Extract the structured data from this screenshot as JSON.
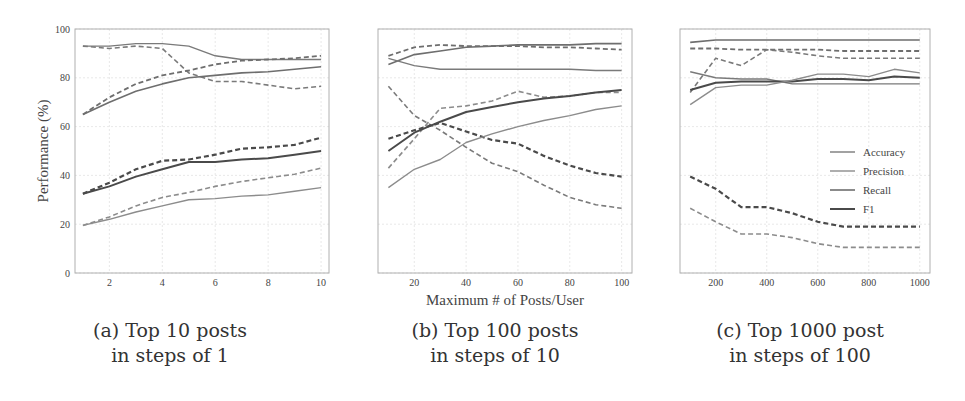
{
  "figure": {
    "ylabel": "Performance (%)",
    "shared_xlabel": "Maximum # of Posts/User",
    "legend": [
      {
        "label": "Accuracy",
        "color": "#7a7a7a",
        "width": 1.4
      },
      {
        "label": "Precision",
        "color": "#8c8c8c",
        "width": 1.4
      },
      {
        "label": "Recall",
        "color": "#6e6e6e",
        "width": 1.6
      },
      {
        "label": "F1",
        "color": "#4a4a4a",
        "width": 2.0
      }
    ],
    "colors": {
      "background": "#ffffff",
      "axis": "#b0b0b0",
      "grid": "#e2e2e2",
      "text": "#444444"
    }
  },
  "captions": [
    {
      "line1": "(a) Top 10 posts",
      "line2": "in steps of 1"
    },
    {
      "line1": "(b) Top 100 posts",
      "line2": "in steps of 10"
    },
    {
      "line1": "(c) Top 1000 post",
      "line2": "in steps of 100"
    }
  ],
  "chart_data": [
    {
      "type": "line",
      "title": "(a) Top 10 posts in steps of 1",
      "xlabel": "",
      "ylabel": "Performance (%)",
      "xlim": [
        0.7,
        10.3
      ],
      "ylim": [
        0,
        100
      ],
      "xticks": [
        2,
        4,
        6,
        8,
        10
      ],
      "yticks": [
        0,
        20,
        40,
        60,
        80,
        100
      ],
      "grid": true,
      "x": [
        1,
        2,
        3,
        4,
        5,
        6,
        7,
        8,
        9,
        10
      ],
      "series": [
        {
          "name": "Accuracy (solid)",
          "metric": "Accuracy",
          "style": "solid",
          "values": [
            93,
            93,
            94,
            94,
            93,
            89,
            87.5,
            87.5,
            87.5,
            87.5
          ]
        },
        {
          "name": "Accuracy (dashed)",
          "metric": "Accuracy",
          "style": "dashed",
          "values": [
            93,
            92,
            93,
            92,
            82,
            78.5,
            78.5,
            77,
            75.5,
            76.5
          ]
        },
        {
          "name": "Recall (solid)",
          "metric": "Recall",
          "style": "solid",
          "values": [
            65,
            70,
            74.5,
            77.5,
            80,
            81,
            82,
            82.5,
            83.5,
            84.5
          ]
        },
        {
          "name": "Recall (dashed)",
          "metric": "Recall",
          "style": "dashed",
          "values": [
            65,
            72,
            77.5,
            81,
            83,
            85.5,
            87,
            87.5,
            88,
            89
          ]
        },
        {
          "name": "F1 (solid)",
          "metric": "F1",
          "style": "solid",
          "values": [
            32.5,
            35.5,
            39.5,
            42.5,
            45.5,
            45.5,
            46.5,
            47,
            48.5,
            50
          ]
        },
        {
          "name": "F1 (dashed)",
          "metric": "F1",
          "style": "dashed",
          "values": [
            32.5,
            37,
            42.5,
            46,
            46.5,
            48.5,
            51,
            51.5,
            52.5,
            55.5
          ]
        },
        {
          "name": "Precision (solid)",
          "metric": "Precision",
          "style": "solid",
          "values": [
            19.5,
            22,
            25,
            27.5,
            30,
            30.5,
            31.5,
            32,
            33.5,
            35
          ]
        },
        {
          "name": "Precision (dashed)",
          "metric": "Precision",
          "style": "dashed",
          "values": [
            19.5,
            23,
            27.5,
            31,
            33,
            35.5,
            37.5,
            39,
            40.5,
            43
          ]
        }
      ]
    },
    {
      "type": "line",
      "title": "(b) Top 100 posts in steps of 10",
      "xlabel": "Maximum # of Posts/User",
      "ylabel": "",
      "xlim": [
        6,
        104
      ],
      "ylim": [
        0,
        100
      ],
      "xticks": [
        20,
        40,
        60,
        80,
        100
      ],
      "yticks": [
        0,
        20,
        40,
        60,
        80,
        100
      ],
      "grid": true,
      "x": [
        10,
        20,
        30,
        40,
        50,
        60,
        70,
        80,
        90,
        100
      ],
      "series": [
        {
          "name": "Recall (solid)",
          "metric": "Recall",
          "style": "solid",
          "values": [
            85.5,
            89.5,
            91,
            92.5,
            93,
            93.5,
            93.5,
            93.5,
            94,
            94
          ]
        },
        {
          "name": "Recall (dashed)",
          "metric": "Recall",
          "style": "dashed",
          "values": [
            89,
            92.5,
            93.5,
            93,
            93,
            93,
            92.5,
            92.5,
            92,
            91.5
          ]
        },
        {
          "name": "Accuracy (solid)",
          "metric": "Accuracy",
          "style": "solid",
          "values": [
            88,
            85,
            83.5,
            83.5,
            83.5,
            83.5,
            83.5,
            83.5,
            83,
            83
          ]
        },
        {
          "name": "Accuracy (dashed)",
          "metric": "Accuracy",
          "style": "dashed",
          "values": [
            76.5,
            64.5,
            58.5,
            51.5,
            45,
            41.5,
            36,
            31,
            28,
            26.5
          ]
        },
        {
          "name": "Precision (dashed)",
          "metric": "Precision",
          "style": "dashed",
          "values": [
            43,
            55,
            67.5,
            68.5,
            70.5,
            74.5,
            72,
            72.5,
            74,
            74
          ]
        },
        {
          "name": "F1 (solid)",
          "metric": "F1",
          "style": "solid",
          "values": [
            50,
            57.5,
            62,
            66,
            68,
            70,
            71.5,
            72.5,
            74,
            75
          ]
        },
        {
          "name": "F1 (dashed)",
          "metric": "F1",
          "style": "dashed",
          "values": [
            55,
            58.5,
            61.5,
            58,
            54.5,
            53,
            48,
            44,
            41,
            39.5
          ]
        },
        {
          "name": "Precision (solid)",
          "metric": "Precision",
          "style": "solid",
          "values": [
            35,
            42.5,
            46.5,
            53.5,
            57,
            60,
            62.5,
            64.5,
            67,
            68.5
          ]
        }
      ]
    },
    {
      "type": "line",
      "title": "(c) Top 1000 post in steps of 100",
      "xlabel": "",
      "ylabel": "",
      "xlim": [
        60,
        1040
      ],
      "ylim": [
        0,
        100
      ],
      "xticks": [
        200,
        400,
        600,
        800,
        1000
      ],
      "yticks": [
        0,
        20,
        40,
        60,
        80,
        100
      ],
      "grid": true,
      "legend_position": "center right",
      "x": [
        100,
        200,
        300,
        400,
        500,
        600,
        700,
        800,
        900,
        1000
      ],
      "series": [
        {
          "name": "Recall (solid)",
          "metric": "Recall",
          "style": "solid",
          "values": [
            94.5,
            95.5,
            95.5,
            95.5,
            95.5,
            95.5,
            95.5,
            95.5,
            95.5,
            95.5
          ]
        },
        {
          "name": "Recall (dashed)",
          "metric": "Recall",
          "style": "dashed",
          "values": [
            92,
            92,
            91.5,
            91.5,
            91.5,
            91.5,
            91,
            91,
            91,
            91
          ]
        },
        {
          "name": "Accuracy (dashed)",
          "metric": "Accuracy",
          "style": "dashed",
          "values": [
            74,
            88,
            85,
            91.5,
            90.5,
            89,
            88,
            88,
            88,
            88
          ]
        },
        {
          "name": "Accuracy (solid)",
          "metric": "Accuracy",
          "style": "solid",
          "values": [
            82.5,
            80,
            79.5,
            79.5,
            77.5,
            77.5,
            77.5,
            77.5,
            77.5,
            77.5
          ]
        },
        {
          "name": "F1 (solid)",
          "metric": "F1",
          "style": "solid",
          "values": [
            75,
            78,
            78.5,
            78.5,
            78.5,
            79.5,
            79.5,
            79,
            80.5,
            80
          ]
        },
        {
          "name": "Precision (solid)",
          "metric": "Precision",
          "style": "solid",
          "values": [
            69,
            76,
            77,
            77,
            79,
            81.5,
            81.5,
            80.5,
            83.5,
            82
          ]
        },
        {
          "name": "F1 (dashed)",
          "metric": "F1",
          "style": "dashed",
          "values": [
            39.5,
            34.5,
            27,
            27,
            24.5,
            21,
            19,
            19,
            19,
            19
          ]
        },
        {
          "name": "Accuracy2 (dashed)",
          "metric": "Precision",
          "style": "dashed",
          "values": [
            26.5,
            21,
            16,
            16,
            14.5,
            12,
            10.5,
            10.5,
            10.5,
            10.5
          ]
        }
      ]
    }
  ]
}
